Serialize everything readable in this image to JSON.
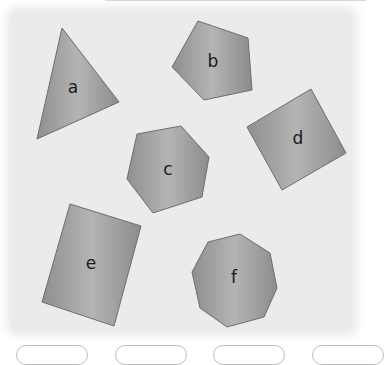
{
  "colors": {
    "page_background": "#ffffff",
    "card_background": "#ebebeb",
    "shape_fill_light": "#b4b4b4",
    "shape_fill_dark": "#8c8c8c",
    "shape_stroke": "#6e6e6e",
    "label_color": "#1a1a1a"
  },
  "shapes": [
    {
      "id": "a",
      "label": "a",
      "type": "triangle",
      "sides": 3,
      "points": "62,28 119,102 37,139",
      "label_pos": [
        73,
        88
      ]
    },
    {
      "id": "b",
      "label": "b",
      "type": "pentagon",
      "sides": 5,
      "points": "198,21 248,38 252,90 204,100 172,67",
      "label_pos": [
        213,
        62
      ]
    },
    {
      "id": "c",
      "label": "c",
      "type": "hexagon",
      "sides": 6,
      "points": "137,134 181,126 209,157 202,197 153,213 127,179",
      "label_pos": [
        168,
        170
      ]
    },
    {
      "id": "d",
      "label": "d",
      "type": "square",
      "sides": 4,
      "points": "247,127 311,89 346,153 282,190",
      "label_pos": [
        298,
        139
      ]
    },
    {
      "id": "e",
      "label": "e",
      "type": "rectangle",
      "sides": 4,
      "points": "70,204 141,226 114,326 42,302",
      "label_pos": [
        91,
        264
      ]
    },
    {
      "id": "f",
      "label": "f",
      "type": "octagon",
      "sides": 8,
      "points": "208,242 240,234 270,253 277,288 264,317 227,327 200,308 192,272",
      "label_pos": [
        234,
        278
      ]
    }
  ],
  "answer_boxes": [
    {
      "left": 16
    },
    {
      "left": 115
    },
    {
      "left": 213
    },
    {
      "left": 312
    }
  ]
}
